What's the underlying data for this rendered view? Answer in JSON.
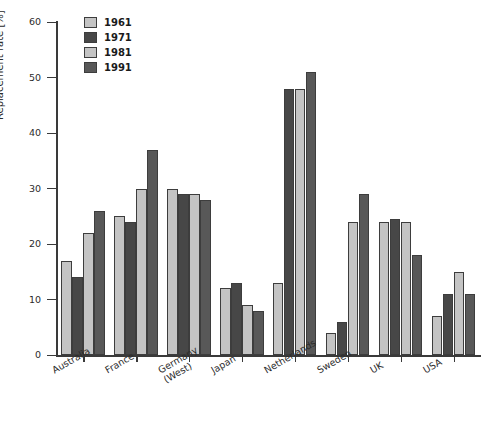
{
  "chart_data": {
    "type": "bar",
    "title": "",
    "xlabel": "",
    "ylabel": "Replacement rate [%]",
    "ylim": [
      0,
      60
    ],
    "yticks": [
      0,
      10,
      20,
      30,
      40,
      50,
      60
    ],
    "grid": false,
    "legend_position": "top-left",
    "categories": [
      "Australia",
      "France",
      "Germany\n(West)",
      "Japan",
      "Netherlands",
      "Sweden",
      "UK",
      "USA"
    ],
    "series": [
      {
        "name": "1961",
        "color": "#c4c4c4",
        "values": [
          17,
          25,
          30,
          12,
          13,
          4,
          24,
          7
        ]
      },
      {
        "name": "1971",
        "color": "#474747",
        "values": [
          14,
          24,
          29,
          13,
          48,
          6,
          24.5,
          11
        ]
      },
      {
        "name": "1981",
        "color": "#c4c4c4",
        "values": [
          22,
          30,
          29,
          9,
          48,
          24,
          24,
          15
        ]
      },
      {
        "name": "1991",
        "color": "#585858",
        "values": [
          26,
          37,
          28,
          8,
          51,
          29,
          18,
          11
        ]
      }
    ]
  },
  "axis": {
    "y_title": "Replacement rate [%]",
    "y_tick_labels": [
      "0",
      "10",
      "20",
      "30",
      "40",
      "50",
      "60"
    ]
  },
  "legend": {
    "entries": [
      {
        "label": "1961",
        "color": "#c4c4c4"
      },
      {
        "label": "1971",
        "color": "#474747"
      },
      {
        "label": "1981",
        "color": "#c4c4c4"
      },
      {
        "label": "1991",
        "color": "#585858"
      }
    ]
  }
}
